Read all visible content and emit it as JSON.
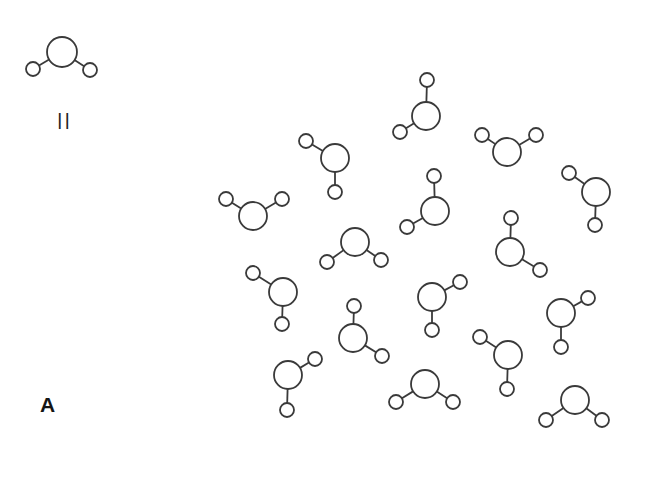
{
  "diagram": {
    "type": "water-molecule-cluster",
    "panel_label": "A",
    "equivalence_symbol": "||",
    "style": {
      "stroke": "#3a3a3a",
      "fill": "#ffffff",
      "background": "#ffffff"
    },
    "atom_radius": {
      "oxygen": 14,
      "hydrogen": 7
    },
    "reference_molecule": {
      "label": "H2O",
      "O": [
        62,
        52
      ],
      "H1": [
        33,
        69
      ],
      "H2": [
        90,
        70
      ]
    },
    "molecules": [
      {
        "O": [
          335,
          158
        ],
        "H1": [
          306,
          141
        ],
        "H2": [
          335,
          192
        ]
      },
      {
        "O": [
          253,
          216
        ],
        "H1": [
          226,
          199
        ],
        "H2": [
          282,
          199
        ]
      },
      {
        "O": [
          426,
          116
        ],
        "H1": [
          427,
          80
        ],
        "H2": [
          400,
          132
        ]
      },
      {
        "O": [
          507,
          152
        ],
        "H1": [
          482,
          135
        ],
        "H2": [
          536,
          135
        ]
      },
      {
        "O": [
          596,
          192
        ],
        "H1": [
          569,
          173
        ],
        "H2": [
          595,
          225
        ]
      },
      {
        "O": [
          435,
          211
        ],
        "H1": [
          434,
          176
        ],
        "H2": [
          407,
          227
        ]
      },
      {
        "O": [
          510,
          252
        ],
        "H1": [
          511,
          218
        ],
        "H2": [
          540,
          270
        ]
      },
      {
        "O": [
          355,
          242
        ],
        "H1": [
          327,
          262
        ],
        "H2": [
          381,
          260
        ]
      },
      {
        "O": [
          283,
          292
        ],
        "H1": [
          253,
          273
        ],
        "H2": [
          282,
          324
        ]
      },
      {
        "O": [
          353,
          338
        ],
        "H1": [
          354,
          306
        ],
        "H2": [
          382,
          356
        ]
      },
      {
        "O": [
          432,
          297
        ],
        "H1": [
          460,
          282
        ],
        "H2": [
          432,
          330
        ]
      },
      {
        "O": [
          561,
          313
        ],
        "H1": [
          588,
          298
        ],
        "H2": [
          561,
          347
        ]
      },
      {
        "O": [
          508,
          355
        ],
        "H1": [
          480,
          337
        ],
        "H2": [
          507,
          389
        ]
      },
      {
        "O": [
          288,
          375
        ],
        "H1": [
          315,
          359
        ],
        "H2": [
          287,
          410
        ]
      },
      {
        "O": [
          425,
          384
        ],
        "H1": [
          396,
          402
        ],
        "H2": [
          453,
          402
        ]
      },
      {
        "O": [
          575,
          400
        ],
        "H1": [
          546,
          420
        ],
        "H2": [
          602,
          420
        ]
      }
    ]
  }
}
